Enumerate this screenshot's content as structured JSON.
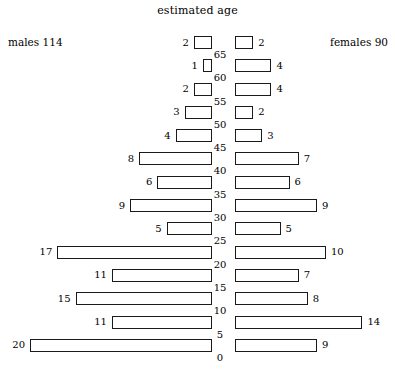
{
  "chart_title": "estimated age",
  "males_label": "males 114",
  "females_label": "females 90",
  "chart_data": {
    "type": "bar",
    "title": "estimated age",
    "subtype": "population-pyramid",
    "xlabel": "",
    "ylabel": "estimated age",
    "orientation": "horizontal",
    "grid": false,
    "legend_position": "top-corners",
    "categories": [
      "65+",
      "60",
      "55",
      "50",
      "45",
      "40",
      "35",
      "30",
      "25",
      "20",
      "15",
      "10",
      "5",
      "0"
    ],
    "age_ticks": [
      "65",
      "60",
      "55",
      "50",
      "45",
      "40",
      "35",
      "30",
      "25",
      "20",
      "15",
      "10",
      "5",
      "0"
    ],
    "series": [
      {
        "name": "males",
        "total": 114,
        "side": "left",
        "values": [
          2,
          1,
          2,
          3,
          4,
          8,
          6,
          9,
          5,
          17,
          11,
          15,
          11,
          20
        ]
      },
      {
        "name": "females",
        "total": 90,
        "side": "right",
        "values": [
          2,
          4,
          4,
          2,
          3,
          7,
          6,
          9,
          5,
          10,
          7,
          8,
          14,
          9
        ]
      }
    ],
    "bar_fill_color": "#ffffff",
    "bar_border_color": "#1a1a1a",
    "background_color": "#ffffff",
    "px_per_unit": 9.1,
    "xlim": [
      0,
      20
    ]
  },
  "rows": [
    {
      "male": "2",
      "female": "2",
      "age": "65"
    },
    {
      "male": "1",
      "female": "4",
      "age": "60"
    },
    {
      "male": "2",
      "female": "4",
      "age": "55"
    },
    {
      "male": "3",
      "female": "2",
      "age": "50"
    },
    {
      "male": "4",
      "female": "3",
      "age": "45"
    },
    {
      "male": "8",
      "female": "7",
      "age": "40"
    },
    {
      "male": "6",
      "female": "6",
      "age": "35"
    },
    {
      "male": "9",
      "female": "9",
      "age": "30"
    },
    {
      "male": "5",
      "female": "5",
      "age": "25"
    },
    {
      "male": "17",
      "female": "10",
      "age": "20"
    },
    {
      "male": "11",
      "female": "7",
      "age": "15"
    },
    {
      "male": "15",
      "female": "8",
      "age": "10"
    },
    {
      "male": "11",
      "female": "14",
      "age": "5"
    },
    {
      "male": "20",
      "female": "9",
      "age": "0"
    }
  ]
}
